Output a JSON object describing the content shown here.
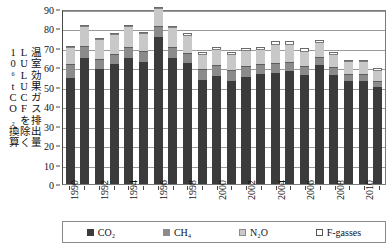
{
  "axis": {
    "y_title_lines": [
      "温室効果ガス排出量",
      "LULUCFを除く",
      "10⁶tCO₂換算"
    ],
    "y_ticks": [
      "0",
      "10",
      "20",
      "30",
      "40",
      "50",
      "60",
      "70",
      "80",
      "90"
    ],
    "x_ticks_visible": [
      "1990",
      "1992",
      "1994",
      "1996",
      "1998",
      "2000",
      "2002",
      "2004",
      "2006",
      "2008",
      "2010"
    ]
  },
  "legend": {
    "items": [
      {
        "label": "CO₂",
        "color": "#3b3b3b",
        "key": "co2"
      },
      {
        "label": "CH₄",
        "color": "#8b8b8b",
        "key": "ch4"
      },
      {
        "label": "N₂O",
        "color": "#c8c8c8",
        "key": "n2o"
      },
      {
        "label": "F-gasses",
        "color": "#ffffff",
        "key": "fgas"
      }
    ]
  },
  "chart_data": {
    "type": "bar",
    "stacked": true,
    "title": "",
    "xlabel": "",
    "ylabel": "温室効果ガス排出量 LULUCFを除く 10⁶tCO₂換算",
    "ylim": [
      0,
      90
    ],
    "ytick_step": 10,
    "grid": true,
    "legend_position": "bottom",
    "categories": [
      "1990",
      "1991",
      "1992",
      "1993",
      "1994",
      "1995",
      "1996",
      "1997",
      "1998",
      "1999",
      "2000",
      "2001",
      "2002",
      "2003",
      "2004",
      "2005",
      "2006",
      "2007",
      "2008",
      "2009",
      "2010",
      "2011"
    ],
    "series": [
      {
        "name": "CO₂",
        "color": "#3b3b3b",
        "values": [
          54.5,
          65.0,
          59.0,
          61.5,
          65.0,
          63.0,
          75.5,
          65.0,
          62.0,
          53.5,
          55.5,
          53.0,
          55.0,
          56.5,
          57.0,
          58.0,
          56.0,
          61.0,
          56.0,
          53.0,
          53.0,
          50.0
        ]
      },
      {
        "name": "CH₄",
        "color": "#8b8b8b",
        "values": [
          6.5,
          5.5,
          5.0,
          5.0,
          5.0,
          5.0,
          5.5,
          5.0,
          5.0,
          5.0,
          5.0,
          5.0,
          5.0,
          4.5,
          4.5,
          4.0,
          4.0,
          4.0,
          3.5,
          3.0,
          3.0,
          2.5
        ]
      },
      {
        "name": "N₂O",
        "color": "#c8c8c8",
        "values": [
          8.5,
          10.0,
          9.5,
          9.5,
          10.0,
          8.5,
          8.5,
          9.5,
          8.5,
          7.5,
          8.0,
          8.0,
          8.0,
          7.5,
          9.5,
          9.0,
          7.5,
          7.0,
          6.5,
          6.0,
          6.0,
          5.0
        ]
      },
      {
        "name": "F-gasses",
        "color": "#ffffff",
        "values": [
          0.5,
          0.5,
          0.5,
          0.5,
          0.5,
          0.5,
          0.5,
          1.0,
          1.0,
          1.0,
          1.0,
          1.0,
          1.0,
          1.0,
          1.5,
          1.5,
          1.5,
          1.0,
          1.0,
          1.0,
          1.0,
          1.0
        ]
      }
    ]
  }
}
